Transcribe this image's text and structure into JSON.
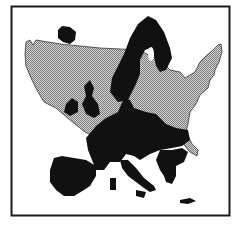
{
  "figure": {
    "title": "Europe overlaid on the United States",
    "colors": {
      "background": "#ffffff",
      "border": "#1a1a1a",
      "usa_fill": "#9a9a9a",
      "usa_hatch_light": "#d8d8d8",
      "europe_fill": "#111111"
    },
    "layers": [
      {
        "name": "United States",
        "style": "crosshatch gray"
      },
      {
        "name": "Europe",
        "style": "solid black"
      }
    ]
  }
}
